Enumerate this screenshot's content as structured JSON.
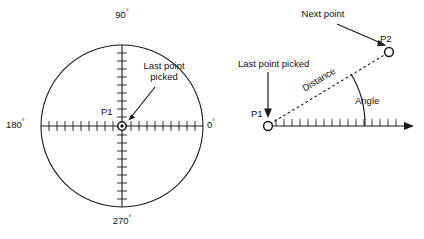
{
  "diagram": {
    "title_alt": "Polar angle convention and distance/angle entry",
    "background_color": "#ffffff",
    "ink_color": "#1a1a1a",
    "left_diagram": {
      "name": "angle-convention-circle",
      "axis_labels": {
        "east": "0",
        "north": "90",
        "west": "180",
        "south": "270",
        "degree_symbol": "°"
      },
      "point_label": "P1",
      "annotation": {
        "line1": "Last point",
        "line2": "picked"
      }
    },
    "right_diagram": {
      "name": "distance-angle-entry",
      "point_labels": {
        "start": "P1",
        "end": "P2"
      },
      "distance_label": "Distance",
      "angle_label": "Angle",
      "annotations": {
        "next_point": "Next point",
        "last_point_picked": "Last point picked"
      }
    }
  }
}
